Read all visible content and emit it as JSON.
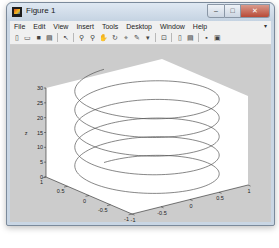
{
  "window": {
    "title": "Figure 1",
    "controls": {
      "minimize": "–",
      "maximize": "□",
      "close": "✕"
    }
  },
  "menubar": {
    "items": [
      {
        "label": "File"
      },
      {
        "label": "Edit"
      },
      {
        "label": "View"
      },
      {
        "label": "Insert"
      },
      {
        "label": "Tools"
      },
      {
        "label": "Desktop"
      },
      {
        "label": "Window"
      },
      {
        "label": "Help"
      }
    ],
    "overflow_arrow": "▾"
  },
  "toolbar": {
    "buttons": [
      {
        "name": "new-figure",
        "glyph": "▯"
      },
      {
        "name": "open-file",
        "glyph": "▭"
      },
      {
        "name": "save-figure",
        "glyph": "■"
      },
      {
        "name": "print-figure",
        "glyph": "▤"
      },
      {
        "name": "edit-plot",
        "glyph": "↖"
      },
      {
        "name": "zoom-in",
        "glyph": "⚲"
      },
      {
        "name": "zoom-out",
        "glyph": "⚲"
      },
      {
        "name": "pan",
        "glyph": "✋"
      },
      {
        "name": "rotate-3d",
        "glyph": "↻"
      },
      {
        "name": "data-cursor",
        "glyph": "⌖"
      },
      {
        "name": "brush",
        "glyph": "✎"
      },
      {
        "name": "brush-dropdown",
        "glyph": "▾"
      },
      {
        "name": "link-plot",
        "glyph": "⊡"
      },
      {
        "name": "insert-colorbar",
        "glyph": "▯"
      },
      {
        "name": "insert-legend",
        "glyph": "▤"
      },
      {
        "name": "hide-plot-tools",
        "glyph": "▪"
      },
      {
        "name": "show-plot-tools",
        "glyph": "▣"
      }
    ]
  },
  "chart_data": {
    "type": "line",
    "subtype": "plot3",
    "title": "",
    "xlabel": "x",
    "ylabel": "y",
    "zlabel": "z",
    "xlim": [
      -1,
      1
    ],
    "ylim": [
      -1,
      1
    ],
    "zlim": [
      0,
      30
    ],
    "xticks": [
      "-1",
      "-0.5",
      "0",
      "0.5",
      "1"
    ],
    "yticks": [
      "-1",
      "-0.5",
      "0",
      "0.5",
      "1"
    ],
    "zticks": [
      "0",
      "5",
      "10",
      "15",
      "20",
      "25",
      "30"
    ],
    "series": [
      {
        "name": "helix",
        "x": "sin(t)",
        "y": "cos(t)",
        "z": "t",
        "t_range": [
          0,
          31.4159
        ],
        "turns": 5,
        "color": "#555555"
      }
    ],
    "grid": false,
    "view": "default 3D (az -37.5, el 30)"
  },
  "colors": {
    "figure_bg": "#cccccc",
    "axes_bg": "#ffffff",
    "line": "#555555"
  }
}
